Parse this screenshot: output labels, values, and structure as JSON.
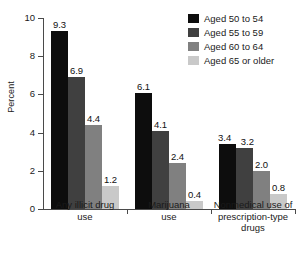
{
  "chart_data": {
    "type": "bar",
    "title": "",
    "xlabel": "",
    "ylabel": "Percent",
    "ylim": [
      0,
      10
    ],
    "yticks": [
      "0",
      "2",
      "4",
      "6",
      "8",
      "10"
    ],
    "grid": false,
    "legend_position": "top-right",
    "categories": [
      "Any illicit drug use",
      "Marijuana use",
      "Nonmedical use of prescription-type drugs"
    ],
    "category_lines": [
      [
        "Any illicit drug",
        "use"
      ],
      [
        "Marijuana",
        "use"
      ],
      [
        "Nonmedical use of",
        "prescription-type",
        "drugs"
      ]
    ],
    "series": [
      {
        "name": "Aged 50 to 54",
        "color": "#0d0d0d",
        "values": [
          9.3,
          6.1,
          3.4
        ],
        "labels": [
          "9.3",
          "6.1",
          "3.4"
        ]
      },
      {
        "name": "Aged 55 to 59",
        "color": "#404040",
        "values": [
          6.9,
          4.1,
          3.2
        ],
        "labels": [
          "6.9",
          "4.1",
          "3.2"
        ]
      },
      {
        "name": "Aged 60 to 64",
        "color": "#808080",
        "values": [
          4.4,
          2.4,
          2.0
        ],
        "labels": [
          "4.4",
          "2.4",
          "2.0"
        ]
      },
      {
        "name": "Aged 65 or older",
        "color": "#c9c9c9",
        "values": [
          1.2,
          0.4,
          0.8
        ],
        "labels": [
          "1.2",
          "0.4",
          "0.8"
        ]
      }
    ]
  }
}
